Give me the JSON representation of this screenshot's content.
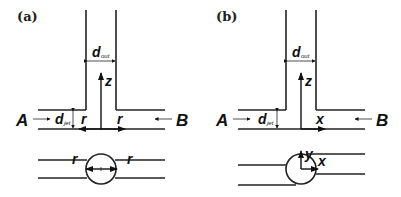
{
  "figure": {
    "panels": [
      {
        "id": "a",
        "label": "(a)",
        "inlet_left": "A",
        "inlet_right": "B",
        "outlet_diameter": {
          "symbol": "d",
          "subscript": "out"
        },
        "jet_diameter": {
          "symbol": "d",
          "subscript": "jet"
        },
        "axis_vertical": "z",
        "axis_left": "r",
        "axis_right": "r",
        "cross_section": {
          "axis_left": "r",
          "axis_right": "r"
        }
      },
      {
        "id": "b",
        "label": "(b)",
        "inlet_left": "A",
        "inlet_right": "B",
        "outlet_diameter": {
          "symbol": "d",
          "subscript": "out"
        },
        "jet_diameter": {
          "symbol": "d",
          "subscript": "jet"
        },
        "axis_vertical": "z",
        "axis_right": "x",
        "cross_section": {
          "axis_up": "y",
          "axis_right": "x"
        }
      }
    ],
    "colors": {
      "line": "#222222",
      "background": "#ffffff"
    }
  }
}
